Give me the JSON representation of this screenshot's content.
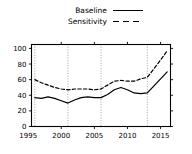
{
  "chart_data": {
    "type": "line",
    "title": "",
    "xlabel": "",
    "ylabel": "",
    "xlim": [
      1995.5,
      2016.5
    ],
    "ylim": [
      0,
      105
    ],
    "grid": false,
    "vertical_reference_lines": [
      1996,
      2001,
      2006,
      2013
    ],
    "legend_position": "above-center",
    "xticks": [
      1995,
      2000,
      2005,
      2010,
      2015
    ],
    "yticks": [
      0,
      20,
      40,
      60,
      80,
      100
    ],
    "x": [
      1996,
      1997,
      1998,
      1999,
      2000,
      2001,
      2002,
      2003,
      2004,
      2005,
      2006,
      2007,
      2008,
      2009,
      2010,
      2011,
      2012,
      2013,
      2014,
      2015,
      2016
    ],
    "series": [
      {
        "name": "Baseline",
        "style": "solid",
        "values": [
          37,
          36,
          38,
          36,
          33,
          30,
          34,
          37,
          38,
          37,
          37,
          41,
          47,
          50,
          47,
          43,
          42,
          43,
          52,
          61,
          70
        ]
      },
      {
        "name": "Sensitivity",
        "style": "dashed",
        "values": [
          60,
          56,
          53,
          50,
          48,
          47,
          48,
          48,
          48,
          47,
          48,
          53,
          58,
          59,
          58,
          58,
          61,
          63,
          74,
          85,
          97
        ]
      }
    ]
  },
  "legend": {
    "entries": [
      {
        "label": "Baseline",
        "key": "solid-line-key"
      },
      {
        "label": "Sensitivity",
        "key": "dashed-line-key"
      }
    ]
  },
  "axes": {
    "x_tick_labels": [
      "1995",
      "2000",
      "2005",
      "2010",
      "2015"
    ],
    "y_tick_labels": [
      "0",
      "20",
      "40",
      "60",
      "80",
      "100"
    ]
  },
  "colors": {
    "line": "#000000",
    "axis": "#000000",
    "reference_line": "#999999",
    "background": "#ffffff"
  }
}
